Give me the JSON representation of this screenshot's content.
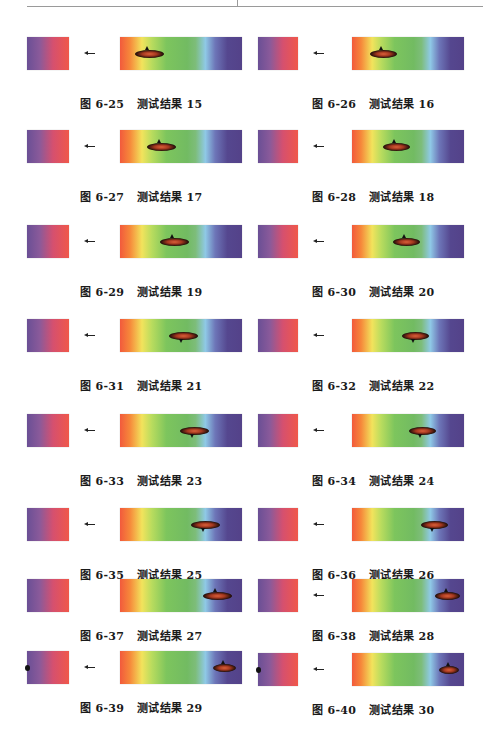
{
  "page": {
    "header_rule": true
  },
  "figures": [
    {
      "id": "6-25",
      "label": "图 6-25",
      "title": "测试结果 15",
      "col": 0,
      "top": 37,
      "arrow": true,
      "blob_x": 0.12,
      "blob_w": 0.3,
      "tip": "up",
      "notch": false
    },
    {
      "id": "6-26",
      "label": "图 6-26",
      "title": "测试结果 16",
      "col": 1,
      "top": 37,
      "arrow": true,
      "blob_x": 0.16,
      "blob_w": 0.3,
      "tip": "up",
      "notch": false
    },
    {
      "id": "6-27",
      "label": "图 6-27",
      "title": "测试结果 17",
      "col": 0,
      "top": 130,
      "arrow": true,
      "blob_x": 0.22,
      "blob_w": 0.3,
      "tip": "up",
      "notch": false
    },
    {
      "id": "6-28",
      "label": "图 6-28",
      "title": "测试结果 18",
      "col": 1,
      "top": 130,
      "arrow": true,
      "blob_x": 0.28,
      "blob_w": 0.3,
      "tip": "up",
      "notch": false
    },
    {
      "id": "6-29",
      "label": "图 6-29",
      "title": "测试结果 19",
      "col": 0,
      "top": 225,
      "arrow": true,
      "blob_x": 0.33,
      "blob_w": 0.3,
      "tip": "up",
      "notch": false
    },
    {
      "id": "6-30",
      "label": "图 6-30",
      "title": "测试结果 20",
      "col": 1,
      "top": 225,
      "arrow": true,
      "blob_x": 0.37,
      "blob_w": 0.3,
      "tip": "up",
      "notch": false
    },
    {
      "id": "6-31",
      "label": "图 6-31",
      "title": "测试结果 21",
      "col": 0,
      "top": 319,
      "arrow": true,
      "blob_x": 0.4,
      "blob_w": 0.3,
      "tip": "down",
      "notch": false
    },
    {
      "id": "6-32",
      "label": "图 6-32",
      "title": "测试结果 22",
      "col": 1,
      "top": 319,
      "arrow": true,
      "blob_x": 0.45,
      "blob_w": 0.3,
      "tip": "down",
      "notch": false
    },
    {
      "id": "6-33",
      "label": "图 6-33",
      "title": "测试结果 23",
      "col": 0,
      "top": 414,
      "arrow": true,
      "blob_x": 0.49,
      "blob_w": 0.3,
      "tip": "down",
      "notch": false
    },
    {
      "id": "6-34",
      "label": "图 6-34",
      "title": "测试结果 24",
      "col": 1,
      "top": 414,
      "arrow": true,
      "blob_x": 0.51,
      "blob_w": 0.3,
      "tip": "down",
      "notch": false
    },
    {
      "id": "6-35",
      "label": "图 6-35",
      "title": "测试结果 25",
      "col": 0,
      "top": 508,
      "arrow": true,
      "blob_x": 0.58,
      "blob_w": 0.3,
      "tip": "down",
      "notch": false
    },
    {
      "id": "6-36",
      "label": "图 6-36",
      "title": "测试结果 26",
      "col": 1,
      "top": 508,
      "arrow": true,
      "blob_x": 0.62,
      "blob_w": 0.3,
      "tip": "down",
      "notch": false
    },
    {
      "id": "6-37",
      "label": "图 6-37",
      "title": "测试结果 27",
      "col": 0,
      "top": 579,
      "arrow": false,
      "blob_x": 0.68,
      "blob_w": 0.3,
      "tip": "up",
      "notch": false
    },
    {
      "id": "6-38",
      "label": "图 6-38",
      "title": "测试结果 28",
      "col": 1,
      "top": 579,
      "arrow": true,
      "blob_x": 0.74,
      "blob_w": 0.28,
      "tip": "up",
      "notch": false
    },
    {
      "id": "6-39",
      "label": "图 6-39",
      "title": "测试结果 29",
      "col": 0,
      "top": 651,
      "arrow": true,
      "blob_x": 0.76,
      "blob_w": 0.24,
      "tip": "up",
      "notch": true
    },
    {
      "id": "6-40",
      "label": "图 6-40",
      "title": "测试结果 30",
      "col": 1,
      "top": 653,
      "arrow": true,
      "blob_x": 0.78,
      "blob_w": 0.22,
      "tip": "up",
      "notch": true
    }
  ],
  "colors": {
    "small_box": [
      "#6a4f95",
      "#d5506f",
      "#f0584a"
    ],
    "spectrum": [
      "#f25a3c",
      "#f2e35c",
      "#7dc55d",
      "#8fc9e6",
      "#55478f"
    ],
    "blob": "#c04a2a"
  }
}
